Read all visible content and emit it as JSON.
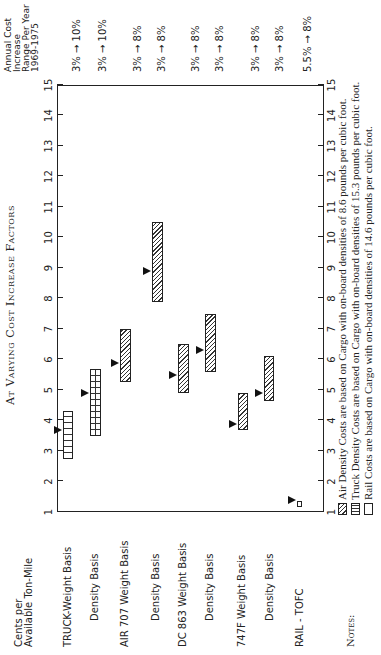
{
  "title": "At Varying Cost Increase Factors",
  "y_axis_label": [
    "Cents per",
    "Available Ton-Mile"
  ],
  "right_header": [
    "Annual Cost",
    "Increase",
    "Range Per Year",
    "1969-1975"
  ],
  "axis_ticks": [
    "1",
    "2",
    "3",
    "4",
    "5",
    "6",
    "7",
    "8",
    "9",
    "10",
    "11",
    "12",
    "13",
    "14",
    "15"
  ],
  "rows": [
    {
      "label": "TRUCK-Weight Basis",
      "pct": "3% → 10%"
    },
    {
      "label": "Density Basis",
      "pct": "3% → 10%"
    },
    {
      "label": "AIR 707 Weight Basis",
      "pct": "3% → 8%"
    },
    {
      "label": "Density Basis",
      "pct": "3% → 8%"
    },
    {
      "label": "DC 863 Weight Basis",
      "pct": "3% → 8%"
    },
    {
      "label": "Density Basis",
      "pct": "3% → 8%"
    },
    {
      "label": "747F Weight Basis",
      "pct": "3% → 8%"
    },
    {
      "label": "Density Basis",
      "pct": "3% → 8%"
    },
    {
      "label": "RAIL - TOFC",
      "pct": "5.5% → 8%"
    }
  ],
  "notes": {
    "label": "Notes:",
    "items": [
      {
        "swatch": "diagonal-hatch",
        "text": "Air Density Costs are based on Cargo with on-board densities of 8.6 pounds per cubic foot."
      },
      {
        "swatch": "vertical-lines",
        "text": "Truck Density Costs are based on Cargo with on-board densities of 15.3 pounds per cubic foot."
      },
      {
        "swatch": "empty",
        "text": "Rail Costs are based on Cargo with on-board densities of 14.6 pounds per cubic foot."
      }
    ]
  },
  "chart_data": {
    "type": "bar",
    "subtype": "floating-range (horizontal, image rotated 90°)",
    "title": "At Varying Cost Increase Factors",
    "xlabel": "Cents per Available Ton-Mile",
    "ylabel": "",
    "xlim": [
      1,
      15
    ],
    "grid": false,
    "categories": [
      "TRUCK - Weight Basis",
      "TRUCK - Density Basis",
      "AIR 707 - Weight Basis",
      "AIR 707 - Density Basis",
      "DC 863 - Weight Basis",
      "DC 863 - Density Basis",
      "747F - Weight Basis",
      "747F - Density Basis",
      "RAIL - TOFC"
    ],
    "series": [
      {
        "name": "range_low",
        "values": [
          2.75,
          3.5,
          5.25,
          7.9,
          4.9,
          5.6,
          3.7,
          4.65,
          1.15
        ]
      },
      {
        "name": "range_high",
        "values": [
          4.3,
          5.7,
          7.0,
          10.5,
          6.5,
          7.5,
          4.9,
          6.1,
          1.35
        ]
      },
      {
        "name": "marker",
        "values": [
          3.7,
          4.9,
          5.9,
          8.9,
          5.5,
          6.3,
          3.9,
          4.9,
          1.4
        ]
      }
    ],
    "patterns": [
      "vertical-lines",
      "grid",
      "diagonal-hatch",
      "diagonal-hatch",
      "diagonal-hatch",
      "diagonal-hatch",
      "diagonal-hatch",
      "diagonal-hatch",
      "empty"
    ],
    "annual_cost_increase_range_1969_1975": [
      "3% → 10%",
      "3% → 10%",
      "3% → 8%",
      "3% → 8%",
      "3% → 8%",
      "3% → 8%",
      "3% → 8%",
      "3% → 8%",
      "5.5% → 8%"
    ]
  }
}
